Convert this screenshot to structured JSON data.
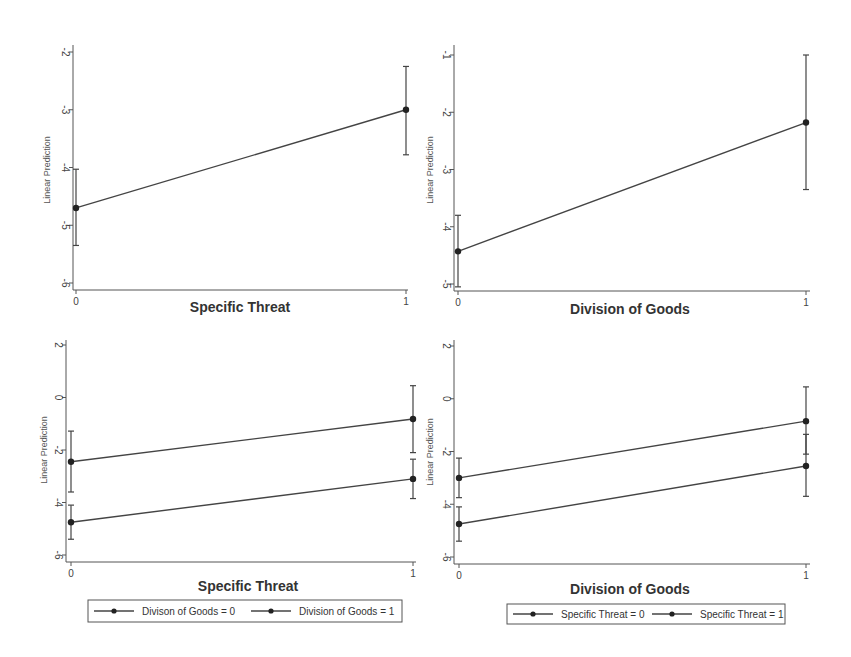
{
  "chart_data": [
    {
      "type": "line",
      "panel": "top-left",
      "title": "",
      "xlabel": "Specific Threat",
      "ylabel": "Linear Prediction",
      "x": [
        0,
        1
      ],
      "x_ticks": [
        "0",
        "1"
      ],
      "y_ticks": [
        "-2",
        "-3",
        "-4",
        "-5",
        "-6"
      ],
      "ylim": [
        -6,
        -2
      ],
      "grid": false,
      "legend": null,
      "series": [
        {
          "name": "",
          "values": [
            -4.7,
            -3.0
          ],
          "ci_low": [
            -5.35,
            -3.78
          ],
          "ci_high": [
            -4.03,
            -2.25
          ]
        }
      ]
    },
    {
      "type": "line",
      "panel": "top-right",
      "title": "",
      "xlabel": "Division of Goods",
      "ylabel": "Linear Prediction",
      "x": [
        0,
        1
      ],
      "x_ticks": [
        "0",
        "1"
      ],
      "y_ticks": [
        "-1",
        "-2",
        "-3",
        "-4",
        "-5"
      ],
      "ylim": [
        -5,
        -1
      ],
      "grid": false,
      "legend": null,
      "series": [
        {
          "name": "",
          "values": [
            -4.43,
            -2.18
          ],
          "ci_low": [
            -5.05,
            -3.35
          ],
          "ci_high": [
            -3.8,
            -1.0
          ]
        }
      ]
    },
    {
      "type": "line",
      "panel": "bottom-left",
      "title": "",
      "xlabel": "Specific Threat",
      "ylabel": "Linear Prediction",
      "x": [
        0,
        1
      ],
      "x_ticks": [
        "0",
        "1"
      ],
      "y_ticks": [
        "2",
        "0",
        "-2",
        "-4",
        "-6"
      ],
      "ylim": [
        -6,
        2
      ],
      "grid": false,
      "legend": {
        "position": "bottom",
        "entries": [
          "Divison of Goods = 0",
          "Division of Goods = 1"
        ]
      },
      "series": [
        {
          "name": "Divison of Goods = 0",
          "values": [
            -4.75,
            -3.1
          ],
          "ci_low": [
            -5.4,
            -3.85
          ],
          "ci_high": [
            -4.1,
            -2.35
          ]
        },
        {
          "name": "Division of Goods = 1",
          "values": [
            -2.45,
            -0.82
          ],
          "ci_low": [
            -3.6,
            -2.1
          ],
          "ci_high": [
            -1.28,
            0.45
          ]
        }
      ]
    },
    {
      "type": "line",
      "panel": "bottom-right",
      "title": "",
      "xlabel": "Division of Goods",
      "ylabel": "Linear Prediction",
      "x": [
        0,
        1
      ],
      "x_ticks": [
        "0",
        "1"
      ],
      "y_ticks": [
        "2",
        "0",
        "-2",
        "-4",
        "-6"
      ],
      "ylim": [
        -6,
        2
      ],
      "grid": false,
      "legend": {
        "position": "bottom",
        "entries": [
          "Specific Threat = 0",
          "Specific Threat = 1"
        ]
      },
      "series": [
        {
          "name": "Specific Threat = 0",
          "values": [
            -4.75,
            -2.55
          ],
          "ci_low": [
            -5.4,
            -3.7
          ],
          "ci_high": [
            -4.1,
            -1.35
          ]
        },
        {
          "name": "Specific Threat = 1",
          "values": [
            -3.0,
            -0.85
          ],
          "ci_low": [
            -3.75,
            -2.1
          ],
          "ci_high": [
            -2.25,
            0.45
          ]
        }
      ]
    }
  ],
  "layout": [
    {
      "x0": 73,
      "x1": 408,
      "xTick0": 76,
      "xTick1": 406,
      "yTop": 45,
      "yBase": 290,
      "tickVal0": -2,
      "tickPix0": 52,
      "tickVal1": -6,
      "tickPix1": 283,
      "xlabelY": 312,
      "xlabelX": 240,
      "ylabelX": 50,
      "ylabelY": 170
    },
    {
      "x0": 454,
      "x1": 810,
      "xTick0": 458,
      "xTick1": 806,
      "yTop": 45,
      "yBase": 291,
      "tickVal0": -1,
      "tickPix0": 55,
      "tickVal1": -5,
      "tickPix1": 284,
      "xlabelY": 314,
      "xlabelX": 630,
      "ylabelX": 433,
      "ylabelY": 170
    },
    {
      "x0": 66,
      "x1": 416,
      "xTick0": 71,
      "xTick1": 413,
      "yTop": 340,
      "yBase": 562,
      "tickVal0": 2,
      "tickPix0": 345,
      "tickVal1": -6,
      "tickPix1": 555,
      "xlabelY": 591,
      "xlabelX": 248,
      "ylabelX": 47,
      "ylabelY": 450,
      "legend": {
        "x": 88,
        "y": 600,
        "w": 314,
        "h": 22
      }
    },
    {
      "x0": 454,
      "x1": 810,
      "xTick0": 459,
      "xTick1": 806,
      "yTop": 340,
      "yBase": 564,
      "tickVal0": 2,
      "tickPix0": 346,
      "tickVal1": -6,
      "tickPix1": 557,
      "xlabelY": 594,
      "xlabelX": 630,
      "ylabelX": 433,
      "ylabelY": 452,
      "legend": {
        "x": 507,
        "y": 604,
        "w": 278,
        "h": 20
      }
    }
  ]
}
